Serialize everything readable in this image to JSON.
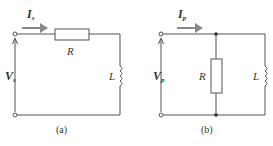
{
  "circuits": [
    {
      "id": "a",
      "caption": "(a)",
      "current": {
        "symbol": "I",
        "sub": "s"
      },
      "voltage": {
        "symbol": "V",
        "sub": "s"
      },
      "resistor": "R",
      "inductor": "L",
      "topology": "series"
    },
    {
      "id": "b",
      "caption": "(b)",
      "current": {
        "symbol": "I",
        "sub": "p"
      },
      "voltage": {
        "symbol": "V",
        "sub": "p"
      },
      "resistor": "R",
      "inductor": "L",
      "topology": "parallel"
    }
  ],
  "colors": {
    "wire": "#555555",
    "arrow": "#888888",
    "text": "#333333"
  }
}
